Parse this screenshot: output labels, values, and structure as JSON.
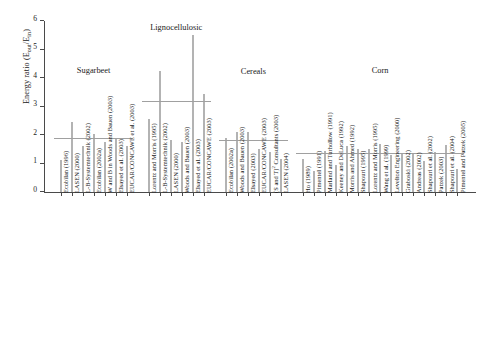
{
  "chart_data": {
    "type": "bar",
    "title": "",
    "xlabel": "",
    "ylabel": "Energy ratio (Eout/Ein)",
    "ylabel_main": "Energy ratio (E",
    "ylabel_sub1": "out",
    "ylabel_mid": "/E",
    "ylabel_sub2": "in",
    "ylabel_end": ")",
    "ylim": [
      0,
      6
    ],
    "yticks": [
      0,
      1,
      2,
      3,
      4,
      5,
      6
    ],
    "ytick_labels": [
      "0",
      "1",
      "2",
      "3",
      "4",
      "5",
      "6"
    ],
    "grid": false,
    "legend": "none",
    "bar_color": "#b3b3b3",
    "meanline_color": "#a0a0a0",
    "axis_color": "#4a4a4a",
    "groups": [
      {
        "name": "Sugarbeet",
        "mean": 1.87,
        "categories": [
          "Ecobilan (1996)",
          "LASEN (2000)",
          "L-B-Systemtechnik (2002)",
          "Ecobilan (2002a)",
          "W and B in Woods and Bauen (2003)",
          "Elsayed et al. (2003)",
          "EUCAR/CONCAWE et al. (2003)"
        ],
        "values": [
          1.12,
          2.45,
          1.63,
          2.02,
          1.75,
          1.9,
          1.6
        ]
      },
      {
        "name": "Lignocellulosic",
        "mean": 3.15,
        "categories": [
          "Lorentz and Morris (1995)",
          "L-B-Systemtechnik (2002)",
          "LASEN (2000)",
          "Woods and Bauen (2003)",
          "Elsayed et al. (2003)",
          "EUCAR/CONCAWE (2003)"
        ],
        "values": [
          2.55,
          4.23,
          1.82,
          1.75,
          5.5,
          3.45
        ]
      },
      {
        "name": "Cereals",
        "mean": 1.8,
        "categories": [
          "Ecobilan (2002a)",
          "Woods and Bauen (2003)",
          "Elsayed (2003)",
          "EUCAR/CONCAWE (2003)",
          "(S and T)2 Consultants (2003)",
          "LASEN (2004)"
        ],
        "values": [
          1.9,
          2.12,
          2.12,
          1.5,
          1.42,
          1.15
        ]
      },
      {
        "name": "Corn",
        "mean": 1.35,
        "categories": [
          "Ho (1989)",
          "Pimentel (1991)",
          "Marland and Turhollow (1991)",
          "Keeney and DeLuca (1992)",
          "Morris and Ahmed (1992)",
          "Shapouri (1995)",
          "Lorentz and Morris (1995)",
          "Wang et al. (1999)",
          "Levelton Engineering (2000)",
          "Graboski (2002)",
          "Andreas (2002)",
          "Shapouri et al. (2002)",
          "Patzek (2003)",
          "Shapouri et al. (2004)",
          "Pimentel and Patzek (2005)"
        ],
        "values": [
          1.15,
          0.75,
          1.45,
          0.95,
          1.6,
          1.5,
          1.52,
          1.7,
          1.3,
          1.38,
          1.38,
          1.1,
          1.42,
          1.65,
          0.8
        ]
      }
    ]
  }
}
